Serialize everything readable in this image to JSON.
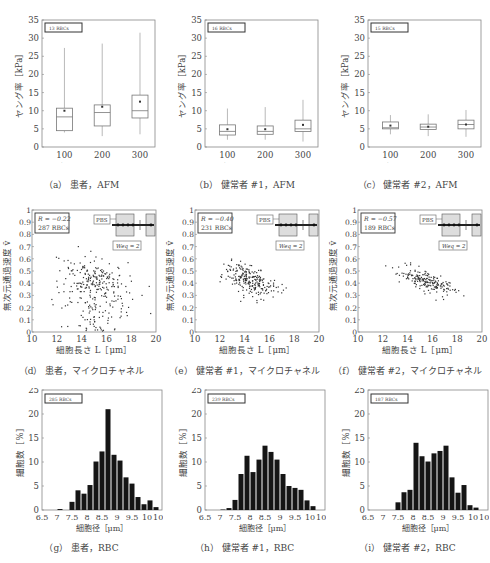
{
  "chart_data": [
    {
      "id": "a",
      "type": "box",
      "caption": "（a） 患者，AFM",
      "badge": "13 RBCs",
      "xlabel": "押込み深さ［nm］",
      "ylabel": "ヤング率［kPa］",
      "ylim": [
        0,
        35
      ],
      "yticks": [
        0,
        5,
        10,
        15,
        20,
        25,
        30,
        35
      ],
      "categories": [
        "100",
        "200",
        "300"
      ],
      "boxes": [
        {
          "min": 4.0,
          "q1": 4.5,
          "median": 8.3,
          "q3": 10.7,
          "max": 27.3,
          "mean": 10.0
        },
        {
          "min": 3.0,
          "q1": 5.8,
          "median": 9.5,
          "q3": 11.6,
          "max": 28.5,
          "mean": 11.1
        },
        {
          "min": 3.5,
          "q1": 8.0,
          "median": 10.0,
          "q3": 14.3,
          "max": 31.5,
          "mean": 12.5
        }
      ]
    },
    {
      "id": "b",
      "type": "box",
      "caption": "（b） 健常者 #1，AFM",
      "badge": "16 RBCs",
      "xlabel": "押込み深さ［nm］",
      "ylabel": "ヤング率［kPa］",
      "ylim": [
        0,
        35
      ],
      "yticks": [
        0,
        5,
        10,
        15,
        20,
        25,
        30,
        35
      ],
      "categories": [
        "100",
        "200",
        "300"
      ],
      "boxes": [
        {
          "min": 2.0,
          "q1": 3.3,
          "median": 4.3,
          "q3": 6.1,
          "max": 10.6,
          "mean": 4.9
        },
        {
          "min": 2.0,
          "q1": 3.5,
          "median": 4.3,
          "q3": 5.8,
          "max": 11.0,
          "mean": 4.9
        },
        {
          "min": 1.5,
          "q1": 4.3,
          "median": 5.0,
          "q3": 7.4,
          "max": 13.0,
          "mean": 6.1
        }
      ]
    },
    {
      "id": "c",
      "type": "box",
      "caption": "（c） 健常者 #2，AFM",
      "badge": "15 RBCs",
      "xlabel": "押込み深さ［nm］",
      "ylabel": "ヤング率［kPa］",
      "ylim": [
        0,
        35
      ],
      "yticks": [
        0,
        5,
        10,
        15,
        20,
        25,
        30,
        35
      ],
      "categories": [
        "100",
        "200",
        "300"
      ],
      "boxes": [
        {
          "min": 3.5,
          "q1": 5.0,
          "median": 5.3,
          "q3": 6.9,
          "max": 8.8,
          "mean": 5.9
        },
        {
          "min": 3.0,
          "q1": 4.8,
          "median": 5.5,
          "q3": 6.3,
          "max": 9.0,
          "mean": 5.6
        },
        {
          "min": 2.8,
          "q1": 5.0,
          "median": 6.2,
          "q3": 7.4,
          "max": 10.2,
          "mean": 6.2
        }
      ]
    },
    {
      "id": "d",
      "type": "scatter",
      "caption": "（d） 患者，マイクロチャネル",
      "stats": {
        "r": "R = −0.22",
        "count": "287 RBCs"
      },
      "inset": {
        "label": "PBS",
        "weq": "Weq = 2"
      },
      "xlabel": "細胞長さ L［μm］",
      "ylabel": "無次元通過速度 ṽ",
      "xlim": [
        10,
        20
      ],
      "ylim": [
        0,
        1
      ],
      "xticks": [
        10,
        12,
        14,
        16,
        18,
        20
      ],
      "yticks": [
        0,
        0.1,
        0.2,
        0.3,
        0.4,
        0.5,
        0.6,
        0.7,
        0.8,
        0.9,
        1
      ],
      "cluster": {
        "cx": 15.2,
        "cy": 0.42,
        "sx": 1.3,
        "sy": 0.1,
        "n": 287,
        "slope": -0.02,
        "low_tail": true
      }
    },
    {
      "id": "e",
      "type": "scatter",
      "caption": "（e） 健常者 #1，マイクロチャネル",
      "stats": {
        "r": "R = −0.40",
        "count": "231 RBCs"
      },
      "inset": {
        "label": "PBS",
        "weq": "Weq = 2"
      },
      "xlabel": "細胞長さ L［μm］",
      "ylabel": "無次元通過速度 ṽ",
      "xlim": [
        10,
        20
      ],
      "ylim": [
        0,
        1
      ],
      "xticks": [
        10,
        12,
        14,
        16,
        18,
        20
      ],
      "yticks": [
        0,
        0.1,
        0.2,
        0.3,
        0.4,
        0.5,
        0.6,
        0.7,
        0.8,
        0.9,
        1
      ],
      "cluster": {
        "cx": 14.6,
        "cy": 0.42,
        "sx": 1.0,
        "sy": 0.06,
        "n": 231,
        "slope": -0.03,
        "low_tail": false
      }
    },
    {
      "id": "f",
      "type": "scatter",
      "caption": "（f） 健常者 #2，マイクロチャネル",
      "stats": {
        "r": "R = −0.57",
        "count": "189 RBCs"
      },
      "inset": {
        "label": "PBS",
        "weq": "Weq = 2"
      },
      "xlabel": "細胞長さ L［μm］",
      "ylabel": "無次元通過速度 ṽ",
      "xlim": [
        10,
        20
      ],
      "ylim": [
        0,
        1
      ],
      "xticks": [
        10,
        12,
        14,
        16,
        18,
        20
      ],
      "yticks": [
        0,
        0.1,
        0.2,
        0.3,
        0.4,
        0.5,
        0.6,
        0.7,
        0.8,
        0.9,
        1
      ],
      "cluster": {
        "cx": 15.6,
        "cy": 0.41,
        "sx": 1.1,
        "sy": 0.04,
        "n": 189,
        "slope": -0.035,
        "low_tail": false
      }
    },
    {
      "id": "g",
      "type": "bar",
      "caption": "（g） 患者，RBC",
      "badge": "285 RBCs",
      "xlabel": "細胞径［μm］",
      "ylabel": "細胞数［%］",
      "xlim": [
        6.5,
        10.5
      ],
      "ylim": [
        0,
        25
      ],
      "xticks": [
        "6.5",
        "7",
        "7.5",
        "8",
        "8.5",
        "9",
        "9.5",
        "10",
        "10.5"
      ],
      "yticks": [
        0,
        5,
        10,
        15,
        20,
        25
      ],
      "bin_width": 0.2,
      "bin_starts": [
        6.6,
        6.8,
        7.0,
        7.2,
        7.4,
        7.6,
        7.8,
        8.0,
        8.2,
        8.4,
        8.6,
        8.8,
        9.0,
        9.2,
        9.4,
        9.6,
        9.8,
        10.0,
        10.2
      ],
      "values": [
        0,
        0,
        0.2,
        0,
        1.7,
        4.1,
        3.4,
        5.2,
        10.1,
        12.2,
        21.0,
        11.5,
        10.3,
        6.8,
        5.5,
        2.7,
        1.2,
        2.0,
        0.6
      ]
    },
    {
      "id": "h",
      "type": "bar",
      "caption": "（h） 健常者 #1，RBC",
      "badge": "239 RBCs",
      "xlabel": "細胞径［μm］",
      "ylabel": "細胞数［%］",
      "xlim": [
        6.5,
        10.5
      ],
      "ylim": [
        0,
        25
      ],
      "xticks": [
        "6.5",
        "7",
        "7.5",
        "8",
        "8.5",
        "9",
        "9.5",
        "10",
        "10.5"
      ],
      "yticks": [
        0,
        5,
        10,
        15,
        20,
        25
      ],
      "bin_width": 0.2,
      "bin_starts": [
        6.6,
        6.8,
        7.0,
        7.2,
        7.4,
        7.6,
        7.8,
        8.0,
        8.2,
        8.4,
        8.6,
        8.8,
        9.0,
        9.2,
        9.4,
        9.6,
        9.8,
        10.0,
        10.2
      ],
      "values": [
        0,
        0,
        0.1,
        0.4,
        2.1,
        7.5,
        11.3,
        7.9,
        10.5,
        13.4,
        12.1,
        10.5,
        7.5,
        5.0,
        4.6,
        4.2,
        2.0,
        0.8,
        0
      ]
    },
    {
      "id": "i",
      "type": "bar",
      "caption": "（i） 健常者 #2，RBC",
      "badge": "187 RBCs",
      "xlabel": "細胞径［μm］",
      "ylabel": "細胞数［%］",
      "xlim": [
        6.5,
        10.5
      ],
      "ylim": [
        0,
        25
      ],
      "xticks": [
        "6.5",
        "7",
        "7.5",
        "8",
        "8.5",
        "9",
        "9.5",
        "10",
        "10.5"
      ],
      "yticks": [
        0,
        5,
        10,
        15,
        20,
        25
      ],
      "bin_width": 0.2,
      "bin_starts": [
        6.6,
        6.8,
        7.0,
        7.2,
        7.4,
        7.6,
        7.8,
        8.0,
        8.2,
        8.4,
        8.6,
        8.8,
        9.0,
        9.2,
        9.4,
        9.6,
        9.8,
        10.0,
        10.2
      ],
      "values": [
        0,
        0,
        0,
        0,
        1.6,
        3.7,
        4.2,
        14.0,
        11.2,
        10.1,
        11.8,
        12.3,
        13.4,
        6.8,
        3.6,
        5.2,
        1.0,
        0.5,
        0
      ]
    }
  ]
}
